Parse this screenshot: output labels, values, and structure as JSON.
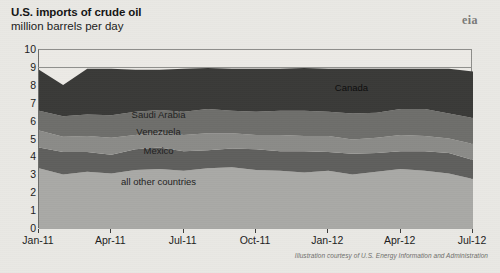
{
  "title": "U.S. imports of crude oil",
  "subtitle": "million barrels per day",
  "logo": {
    "text": "eia",
    "name": "eia-logo"
  },
  "credit": "Illustration courtesy of U.S. Energy Information and Administration",
  "chart_data": {
    "type": "area",
    "stacked": true,
    "title": "U.S. imports of crude oil",
    "subtitle": "million barrels per day",
    "xlabel": "",
    "ylabel": "million barrels per day",
    "ylim": [
      0,
      10
    ],
    "yticks": [
      0,
      1,
      2,
      3,
      4,
      5,
      6,
      7,
      8,
      9,
      10
    ],
    "ytick_labels": [
      "0",
      "1",
      "2",
      "3",
      "4",
      "5",
      "6",
      "7",
      "8",
      "9",
      "10"
    ],
    "grid": "horizontal-at-9-only",
    "legend": "inline-labels",
    "xtick_labels": [
      "Jan-11",
      "Apr-11",
      "Jul-11",
      "Oct-11",
      "Jan-12",
      "Apr-12",
      "Jul-12"
    ],
    "x_months": [
      "Jan-11",
      "Feb-11",
      "Mar-11",
      "Apr-11",
      "May-11",
      "Jun-11",
      "Jul-11",
      "Aug-11",
      "Sep-11",
      "Oct-11",
      "Nov-11",
      "Dec-11",
      "Jan-12",
      "Feb-12",
      "Mar-12",
      "Apr-12",
      "May-12",
      "Jun-12",
      "Jul-12"
    ],
    "series": [
      {
        "name": "all other countries",
        "color": "#a9a9a6",
        "label_x_month": "Jun-11",
        "label_y": 2.6,
        "values": [
          3.4,
          3.05,
          3.2,
          3.1,
          3.3,
          3.35,
          3.25,
          3.4,
          3.45,
          3.3,
          3.25,
          3.15,
          3.25,
          3.05,
          3.2,
          3.35,
          3.25,
          3.1,
          2.8
        ]
      },
      {
        "name": "Mexico",
        "color": "#5f5f5d",
        "label_x_month": "Jun-11",
        "label_y": 4.35,
        "values": [
          1.15,
          1.25,
          1.1,
          1.05,
          1.15,
          1.2,
          1.1,
          1.0,
          1.05,
          1.15,
          1.1,
          1.2,
          1.05,
          1.15,
          1.05,
          1.0,
          1.1,
          1.15,
          1.05
        ]
      },
      {
        "name": "Venezuela",
        "color": "#8b8b88",
        "label_x_month": "Jun-11",
        "label_y": 5.4,
        "values": [
          0.95,
          0.85,
          0.9,
          0.95,
          0.8,
          0.85,
          0.9,
          0.95,
          0.85,
          0.8,
          0.9,
          0.85,
          0.9,
          0.8,
          0.85,
          0.9,
          0.85,
          0.8,
          0.9
        ]
      },
      {
        "name": "Saudi Arabia",
        "color": "#6e6e6b",
        "label_x_month": "Jun-11",
        "label_y": 6.35,
        "values": [
          1.1,
          1.15,
          1.2,
          1.25,
          1.3,
          1.25,
          1.3,
          1.35,
          1.25,
          1.3,
          1.35,
          1.4,
          1.35,
          1.45,
          1.4,
          1.45,
          1.5,
          1.4,
          1.45
        ]
      },
      {
        "name": "Canada",
        "color": "#3a3a38",
        "label_x_month": "Feb-12",
        "label_y": 7.85,
        "values": [
          2.3,
          1.75,
          2.55,
          2.6,
          2.35,
          2.25,
          2.4,
          2.3,
          2.35,
          2.4,
          2.35,
          2.4,
          2.4,
          2.5,
          2.45,
          2.25,
          2.25,
          2.5,
          2.6
        ]
      }
    ]
  }
}
